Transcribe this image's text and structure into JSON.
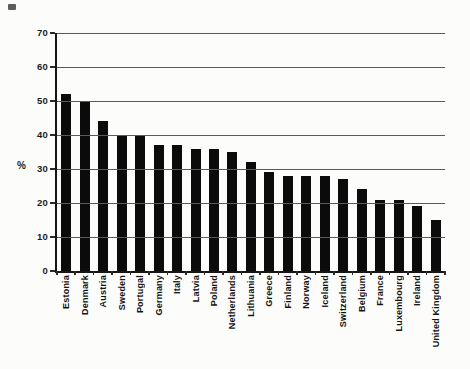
{
  "chart_data": {
    "type": "bar",
    "title": "",
    "xlabel": "",
    "ylabel": "%",
    "ylim": [
      0,
      70
    ],
    "yticks": [
      0,
      10,
      20,
      30,
      40,
      50,
      60,
      70
    ],
    "grid": true,
    "legend": false,
    "bar_color": "#0b0b0b",
    "gridline_color": "#5a5a5a",
    "categories": [
      "Estonia",
      "Denmark",
      "Austria",
      "Sweden",
      "Portugal",
      "Germany",
      "Italy",
      "Latvia",
      "Poland",
      "Netherlands",
      "Lithuania",
      "Greece",
      "Finland",
      "Norway",
      "Iceland",
      "Switzerland",
      "Belgium",
      "France",
      "Luxembourg",
      "Ireland",
      "United Kingdom"
    ],
    "values": [
      52,
      50,
      44,
      40,
      40,
      37,
      37,
      36,
      36,
      35,
      32,
      29,
      28,
      28,
      28,
      27,
      24,
      21,
      21,
      19,
      15
    ]
  }
}
